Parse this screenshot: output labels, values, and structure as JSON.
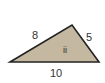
{
  "figure": {
    "type": "triangle",
    "fill_color": "#c4b8a0",
    "stroke_color": "#222222",
    "vertices": [
      [
        10,
        62
      ],
      [
        72,
        25
      ],
      [
        99,
        62
      ]
    ],
    "side_labels": {
      "left": "8",
      "right": "5",
      "bottom": "10"
    },
    "interior_label": "ii"
  }
}
